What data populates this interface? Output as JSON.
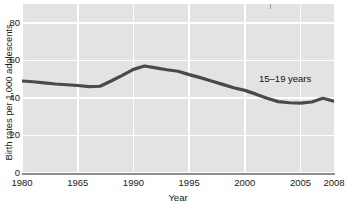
{
  "chart_data": {
    "type": "line",
    "title": "",
    "xlabel": "Year",
    "ylabel": "Birth rates per 1,000 adolescents",
    "xlim": [
      1980,
      2008
    ],
    "ylim": [
      0,
      90
    ],
    "grid": true,
    "legend_position": "inline-annotation",
    "annotations": [
      {
        "text": "15–19 years",
        "x": 2004,
        "y": 49
      }
    ],
    "yticks": [
      0,
      20,
      40,
      60,
      80
    ],
    "ytick_labels": [
      "0",
      "20",
      "40",
      "60",
      "80"
    ],
    "xticks": [
      1980,
      1985,
      1990,
      1995,
      2000,
      2005,
      2008
    ],
    "xtick_labels": [
      "1980",
      "1965",
      "1990",
      "1995",
      "2000",
      "2005",
      "2008"
    ],
    "series": [
      {
        "name": "15–19 years",
        "color": "#4a4a4a",
        "x": [
          1980,
          1981,
          1982,
          1983,
          1984,
          1985,
          1986,
          1987,
          1988,
          1989,
          1990,
          1991,
          1992,
          1993,
          1994,
          1995,
          1996,
          1997,
          1998,
          1999,
          2000,
          2001,
          2002,
          2003,
          2004,
          2005,
          2006,
          2007,
          2008
        ],
        "values": [
          49.0,
          48.6,
          48.0,
          47.4,
          47.0,
          46.6,
          46.0,
          46.2,
          49.0,
          52.0,
          55.2,
          57.0,
          56.0,
          55.0,
          54.2,
          52.4,
          50.8,
          49.0,
          47.2,
          45.4,
          44.0,
          42.0,
          39.8,
          38.0,
          37.4,
          37.2,
          37.8,
          39.8,
          38.2
        ]
      }
    ]
  }
}
